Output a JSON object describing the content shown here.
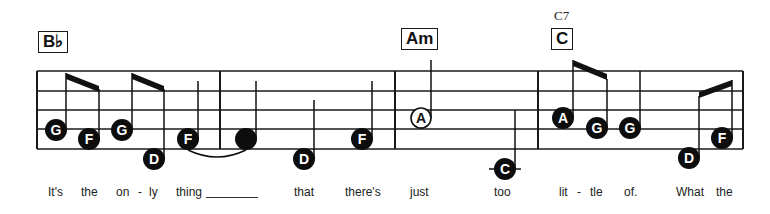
{
  "chords": [
    {
      "label": "B♭",
      "x": 38,
      "y": 31
    },
    {
      "label": "Am",
      "x": 401,
      "y": 28
    },
    {
      "label": "C",
      "x": 551,
      "y": 28,
      "alt": "C7",
      "alt_x": 554,
      "alt_y": 8
    }
  ],
  "staff": {
    "left": 37,
    "right": 743,
    "lines_y": [
      71,
      91,
      110,
      129,
      149
    ],
    "barlines_x": [
      37,
      220,
      395,
      538,
      743
    ],
    "color": "#1a1a1a"
  },
  "notes": [
    {
      "name": "G",
      "x": 56,
      "y": 130,
      "style": "filled",
      "stem": "up",
      "stem_x": 66,
      "stem_top": 73
    },
    {
      "name": "F",
      "x": 89,
      "y": 139,
      "style": "filled",
      "stem": "up",
      "stem_x": 99,
      "stem_top": 89
    },
    {
      "name": "G",
      "x": 122,
      "y": 130,
      "style": "filled",
      "stem": "up",
      "stem_x": 132,
      "stem_top": 73
    },
    {
      "name": "D",
      "x": 154,
      "y": 159,
      "style": "filled",
      "stem": "up",
      "stem_x": 164,
      "stem_top": 89
    },
    {
      "name": "F",
      "x": 188,
      "y": 139,
      "style": "filled",
      "stem": "up",
      "stem_x": 198,
      "stem_top": 81
    },
    {
      "name": "",
      "x": 246,
      "y": 139,
      "style": "filled",
      "stem": "up",
      "stem_x": 256,
      "stem_top": 81
    },
    {
      "name": "D",
      "x": 304,
      "y": 159,
      "style": "filled",
      "stem": "up",
      "stem_x": 314,
      "stem_top": 100
    },
    {
      "name": "F",
      "x": 362,
      "y": 139,
      "style": "filled",
      "stem": "up",
      "stem_x": 372,
      "stem_top": 81
    },
    {
      "name": "A",
      "x": 421,
      "y": 118,
      "style": "open",
      "stem": "up",
      "stem_x": 431,
      "stem_top": 60
    },
    {
      "name": "C",
      "x": 505,
      "y": 169,
      "style": "filled",
      "stem": "up",
      "stem_x": 515,
      "stem_top": 110,
      "ledger": true
    },
    {
      "name": "A",
      "x": 563,
      "y": 118,
      "style": "filled",
      "stem": "up",
      "stem_x": 573,
      "stem_top": 60
    },
    {
      "name": "G",
      "x": 597,
      "y": 128,
      "style": "filled",
      "stem": "up",
      "stem_x": 607,
      "stem_top": 79
    },
    {
      "name": "G",
      "x": 630,
      "y": 128,
      "style": "filled",
      "stem": "up",
      "stem_x": 640,
      "stem_top": 71
    },
    {
      "name": "D",
      "x": 689,
      "y": 158,
      "style": "filled",
      "stem": "up",
      "stem_x": 699,
      "stem_top": 96
    },
    {
      "name": "F",
      "x": 722,
      "y": 138,
      "style": "filled",
      "stem": "up",
      "stem_x": 732,
      "stem_top": 80
    }
  ],
  "beams": [
    {
      "x1": 66,
      "y1": 73,
      "x2": 99,
      "y2": 86
    },
    {
      "x1": 132,
      "y1": 73,
      "x2": 164,
      "y2": 86
    },
    {
      "x1": 573,
      "y1": 60,
      "x2": 607,
      "y2": 74
    },
    {
      "x1": 699,
      "y1": 92,
      "x2": 732,
      "y2": 80
    }
  ],
  "ties": [
    {
      "x1": 188,
      "y1": 150,
      "x2": 246,
      "y2": 150
    }
  ],
  "lyrics": [
    {
      "text": "It's",
      "x": 48
    },
    {
      "text": "the",
      "x": 81
    },
    {
      "text": "on",
      "x": 116
    },
    {
      "text": "-",
      "x": 138
    },
    {
      "text": "ly",
      "x": 149
    },
    {
      "text": "thing",
      "x": 176
    },
    {
      "text": "that",
      "x": 294
    },
    {
      "text": "there's",
      "x": 345
    },
    {
      "text": "just",
      "x": 410
    },
    {
      "text": "too",
      "x": 494
    },
    {
      "text": "lit",
      "x": 559
    },
    {
      "text": "-",
      "x": 577
    },
    {
      "text": "tle",
      "x": 590
    },
    {
      "text": "of.",
      "x": 624
    },
    {
      "text": "What",
      "x": 676
    },
    {
      "text": "the",
      "x": 716
    }
  ],
  "extender": {
    "x": 206,
    "width": 52
  }
}
